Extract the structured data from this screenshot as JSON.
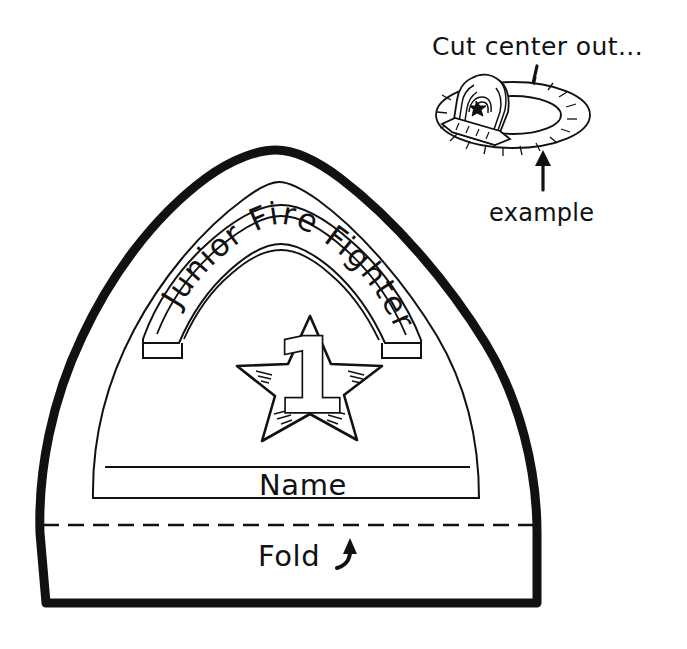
{
  "page": {
    "background_color": "#ffffff",
    "ink_color": "#111111",
    "width": 687,
    "height": 649
  },
  "annotations": {
    "cut_instruction": "Cut center out...",
    "example_label": "example"
  },
  "badge": {
    "banner_text": "Junior Fire Fighter",
    "banner_words": [
      "Junior",
      "Fire",
      "Fighter"
    ],
    "star_number": "1",
    "name_label": "Name",
    "fold_label": "Fold"
  },
  "icons": {
    "cut_arrow": "arrow-down-icon",
    "example_arrow": "arrow-up-icon",
    "fold_arrow": "curved-arrow-up-icon",
    "star": "star-icon",
    "hat": "firefighter-hat-icon"
  }
}
